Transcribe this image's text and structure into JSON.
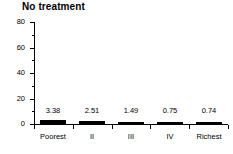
{
  "chart_data": {
    "type": "bar",
    "title": "No treatment",
    "xlabel": "",
    "ylabel": "",
    "categories": [
      "Poorest",
      "II",
      "III",
      "IV",
      "Richest"
    ],
    "values": [
      3.38,
      2.51,
      1.49,
      0.75,
      0.74
    ],
    "value_labels": [
      "3.38",
      "2.51",
      "1.49",
      "0.75",
      "0.74"
    ],
    "ylim": [
      0,
      80
    ],
    "ymajor_ticks": [
      0,
      20,
      40,
      60,
      80
    ],
    "ytick_labels": [
      "0",
      "20",
      "40",
      "60",
      "80"
    ],
    "yminor_ticks": [
      10,
      30,
      50,
      70
    ],
    "grid": false,
    "legend": null,
    "bar_color": "#000000",
    "axis_color": "#000000",
    "background_color": "#ffffff"
  }
}
